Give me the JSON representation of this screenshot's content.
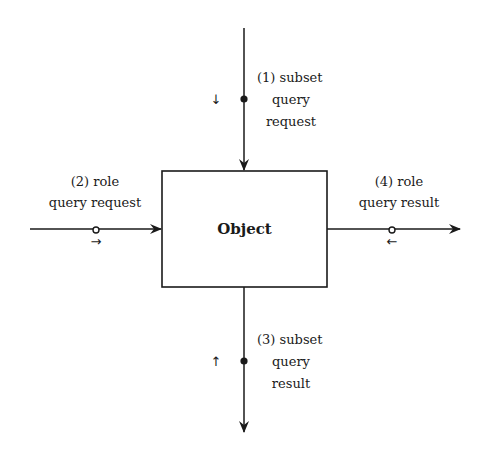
{
  "diagram": {
    "object": {
      "label": "Object"
    },
    "flows": [
      {
        "id": "1",
        "lines": [
          "(1) subset",
          "query",
          "request"
        ],
        "direction_glyph": "↓",
        "port": "top",
        "marker": "filled-dot"
      },
      {
        "id": "2",
        "lines": [
          "(2) role",
          "query request"
        ],
        "direction_glyph": "→",
        "port": "left",
        "marker": "open-circle"
      },
      {
        "id": "3",
        "lines": [
          "(3) subset",
          "query",
          "result"
        ],
        "direction_glyph": "↑",
        "port": "bottom",
        "marker": "filled-dot"
      },
      {
        "id": "4",
        "lines": [
          "(4) role",
          "query result"
        ],
        "direction_glyph": "←",
        "port": "right",
        "marker": "open-circle"
      }
    ],
    "colors": {
      "stroke": "#1a1a1a",
      "background": "#ffffff"
    }
  }
}
